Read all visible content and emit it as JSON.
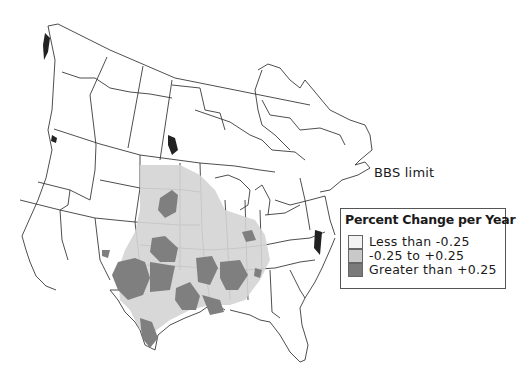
{
  "map": {
    "subject": "North America breeding bird trend map",
    "region_label": "BBS limit",
    "colors": {
      "background": "#ffffff",
      "borders": "#3a3a3a",
      "decline": "#f2f2f2",
      "stable": "#c9c9c9",
      "increase": "#7a7a7a"
    }
  },
  "legend": {
    "title": "Percent Change per Year",
    "items": [
      {
        "label": "Less than -0.25",
        "color": "#f2f2f2"
      },
      {
        "label": "-0.25 to +0.25",
        "color": "#c9c9c9"
      },
      {
        "label": "Greater than +0.25",
        "color": "#7a7a7a"
      }
    ]
  }
}
